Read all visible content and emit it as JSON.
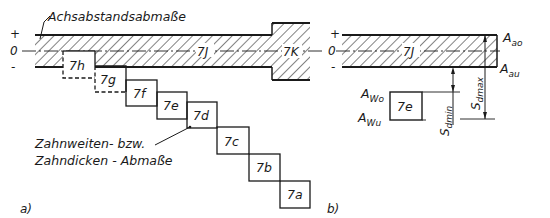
{
  "colors": {
    "ink": "#1a1a1a",
    "background": "#ffffff"
  },
  "panel_a": {
    "caption": "a)",
    "signs": {
      "plus": "+",
      "zero": "0",
      "minus": "-"
    },
    "axis_label": "Achsabstandsabmaße",
    "band_label": "7J",
    "block_label": "7K",
    "boxes": [
      {
        "label": "7h",
        "x": 63,
        "y": 51,
        "dashed": true
      },
      {
        "label": "7g",
        "x": 95,
        "y": 66,
        "dashed": true
      },
      {
        "label": "7f",
        "x": 126,
        "y": 80,
        "dashed": false
      },
      {
        "label": "7e",
        "x": 157,
        "y": 92,
        "dashed": false
      },
      {
        "label": "7d",
        "x": 187,
        "y": 102,
        "dashed": false
      },
      {
        "label": "7c",
        "x": 217,
        "y": 127,
        "dashed": false
      },
      {
        "label": "7b",
        "x": 249,
        "y": 154,
        "dashed": false
      },
      {
        "label": "7a",
        "x": 280,
        "y": 181,
        "dashed": false
      }
    ],
    "callout_line1": "Zahnweiten- bzw.",
    "callout_line2": "Zahndicken - Abmaße"
  },
  "panel_b": {
    "caption": "b)",
    "signs": {
      "plus": "+",
      "zero": "0",
      "minus": "-"
    },
    "band_label": "7J",
    "box_label": "7e",
    "A_ao": {
      "main": "A",
      "sub": "ao"
    },
    "A_au": {
      "main": "A",
      "sub": "au"
    },
    "A_Wo": {
      "main": "A",
      "sub": "Wo"
    },
    "A_Wu": {
      "main": "A",
      "sub": "Wu"
    },
    "S_dmin": {
      "main": "S",
      "sub": "dmin"
    },
    "S_dmax": {
      "main": "S",
      "sub": "dmax"
    }
  }
}
